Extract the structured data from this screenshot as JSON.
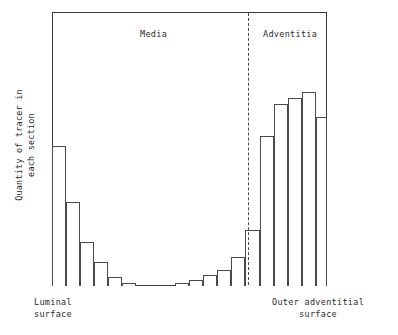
{
  "figure": {
    "y_axis_title_line1": "Quantity of tracer in",
    "y_axis_title_line2": "each section",
    "region_labels": {
      "media": "Media",
      "adventitia": "Adventitia"
    },
    "axis_end_labels": {
      "left_line1": "Luminal",
      "left_line2": "surface",
      "right_line1": "Outer adventitial",
      "right_line2": "surface"
    },
    "colors": {
      "frame": "#3a3a3a",
      "bar_outline": "#4a4a4a",
      "bar_fill": "#ffffff",
      "divider": "#4a4a4a",
      "text": "#2b2b2b",
      "background": "#ffffff"
    }
  },
  "chart_data": {
    "type": "bar",
    "title": "",
    "subtitle": "",
    "xlabel": "",
    "ylabel": "Quantity of tracer in each section",
    "xlim": [
      0,
      20
    ],
    "ylim": [
      0,
      100
    ],
    "grid": false,
    "legend": null,
    "axis_tick_labels": {
      "x": [
        "Luminal surface",
        "Outer adventitial surface"
      ],
      "y": []
    },
    "annotations": [
      {
        "text": "Media",
        "x": 6.0,
        "y": 96,
        "type": "region-label"
      },
      {
        "text": "Adventitia",
        "x": 15.6,
        "y": 96,
        "type": "region-label"
      },
      {
        "text": "media-adventitia boundary",
        "x": 14.25,
        "type": "vertical-dashed-line"
      }
    ],
    "categories": [
      "1",
      "2",
      "3",
      "4",
      "5",
      "6",
      "7",
      "8",
      "9",
      "10",
      "11",
      "12",
      "13",
      "14",
      "15",
      "16",
      "17",
      "18",
      "19",
      "20"
    ],
    "values": [
      51,
      31,
      16,
      9,
      3,
      1,
      0,
      0,
      0,
      1,
      2,
      4,
      6,
      11,
      20,
      55,
      66,
      69,
      71,
      62
    ],
    "bars": [
      {
        "index": 1,
        "x_left": 0,
        "width": 14,
        "height": 140,
        "region": "media"
      },
      {
        "index": 2,
        "x_left": 14,
        "width": 14,
        "height": 84,
        "region": "media"
      },
      {
        "index": 3,
        "x_left": 28,
        "width": 14,
        "height": 44,
        "region": "media"
      },
      {
        "index": 4,
        "x_left": 42,
        "width": 14,
        "height": 24,
        "region": "media"
      },
      {
        "index": 5,
        "x_left": 56,
        "width": 14,
        "height": 9,
        "region": "media"
      },
      {
        "index": 6,
        "x_left": 70,
        "width": 14,
        "height": 3,
        "region": "media"
      },
      {
        "index": 7,
        "x_left": 84,
        "width": 13,
        "height": 0,
        "region": "media"
      },
      {
        "index": 8,
        "x_left": 97,
        "width": 13,
        "height": 0,
        "region": "media"
      },
      {
        "index": 9,
        "x_left": 110,
        "width": 13,
        "height": 0,
        "region": "media"
      },
      {
        "index": 10,
        "x_left": 123,
        "width": 14,
        "height": 3,
        "region": "media"
      },
      {
        "index": 11,
        "x_left": 137,
        "width": 14,
        "height": 6,
        "region": "media"
      },
      {
        "index": 12,
        "x_left": 151,
        "width": 14,
        "height": 11,
        "region": "media"
      },
      {
        "index": 13,
        "x_left": 165,
        "width": 14,
        "height": 16,
        "region": "media"
      },
      {
        "index": 14,
        "x_left": 179,
        "width": 14,
        "height": 29,
        "region": "media"
      },
      {
        "index": 15,
        "x_left": 193,
        "width": 15,
        "height": 56,
        "region": "adventitia"
      },
      {
        "index": 16,
        "x_left": 208,
        "width": 14,
        "height": 150,
        "region": "adventitia"
      },
      {
        "index": 17,
        "x_left": 222,
        "width": 14,
        "height": 182,
        "region": "adventitia"
      },
      {
        "index": 18,
        "x_left": 236,
        "width": 14,
        "height": 188,
        "region": "adventitia"
      },
      {
        "index": 19,
        "x_left": 250,
        "width": 14,
        "height": 194,
        "region": "adventitia"
      },
      {
        "index": 20,
        "x_left": 264,
        "width": 11,
        "height": 169,
        "region": "adventitia"
      }
    ],
    "divider_x_px": 196
  }
}
